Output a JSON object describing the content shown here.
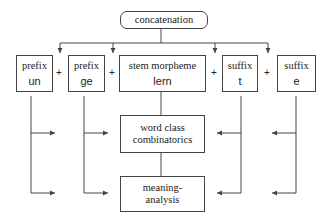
{
  "diagram": {
    "top": {
      "label": "concatenation"
    },
    "components": [
      {
        "type": "prefix",
        "morph": "un"
      },
      {
        "type": "prefix",
        "morph": "ge"
      },
      {
        "type": "stem morpheme",
        "morph": "lern"
      },
      {
        "type": "suffix",
        "morph": "t"
      },
      {
        "type": "suffix",
        "morph": "e"
      }
    ],
    "operator": "+",
    "stages": [
      {
        "label_line1": "word class",
        "label_line2": "combinatorics"
      },
      {
        "label_line1": "meaning-",
        "label_line2": "analysis"
      }
    ],
    "line_color": "#444444"
  }
}
